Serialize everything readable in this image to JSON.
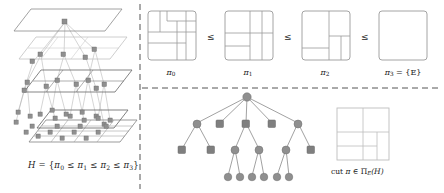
{
  "figure": {
    "panels": [
      "lattice-pyramid",
      "partition-chain",
      "cut-tree"
    ]
  },
  "left_panel": {
    "name": "lattice-pyramid",
    "caption_prefix": "H",
    "caption_eq": " = {",
    "caption_chain": [
      {
        "sym": "π",
        "sub": "0"
      },
      {
        "rel": "≤"
      },
      {
        "sym": "π",
        "sub": "1"
      },
      {
        "rel": "≤"
      },
      {
        "sym": "π",
        "sub": "2"
      },
      {
        "rel": "≤"
      },
      {
        "sym": "π",
        "sub": "3"
      }
    ],
    "caption_suffix": "}",
    "caption_text": "H = {π0 ≤ π1 ≤ π2 ≤ π3}",
    "levels": 4,
    "level_node_counts": [
      1,
      3,
      6,
      12
    ],
    "plane_colors": [
      "#8a8a8a",
      "#b9b9b9",
      "#6f6f6f",
      "#8a8a8a"
    ],
    "node_shape": "square",
    "node_color": "#8f8f8f"
  },
  "top_right_panel": {
    "name": "partition-chain",
    "relation_symbol": "≤",
    "items": [
      {
        "id": "pi0",
        "label": "π",
        "sublabel": "0",
        "label_full": "π0",
        "cells": 9,
        "lines": [
          {
            "type": "v",
            "x": 0.26,
            "y1": 0.0,
            "y2": 0.42
          },
          {
            "type": "v",
            "x": 0.4,
            "y1": 0.0,
            "y2": 0.2
          },
          {
            "type": "h",
            "y": 0.2,
            "x1": 0.4,
            "x2": 1.0
          },
          {
            "type": "h",
            "y": 0.42,
            "x1": 0.0,
            "x2": 1.0
          },
          {
            "type": "v",
            "x": 0.6,
            "y1": 0.2,
            "y2": 1.0
          },
          {
            "type": "v",
            "x": 0.8,
            "y1": 0.0,
            "y2": 1.0
          },
          {
            "type": "h",
            "y": 0.62,
            "x1": 0.0,
            "x2": 0.8
          },
          {
            "type": "h",
            "y": 0.42,
            "x1": 0.6,
            "x2": 1.0
          }
        ]
      },
      {
        "id": "pi1",
        "label": "π",
        "sublabel": "1",
        "label_full": "π1",
        "cells": 7,
        "lines": [
          {
            "type": "v",
            "x": 0.52,
            "y1": 0.0,
            "y2": 1.0
          },
          {
            "type": "v",
            "x": 0.76,
            "y1": 0.0,
            "y2": 1.0
          },
          {
            "type": "h",
            "y": 0.44,
            "x1": 0.0,
            "x2": 1.0
          },
          {
            "type": "h",
            "y": 0.72,
            "x1": 0.0,
            "x2": 0.52
          }
        ]
      },
      {
        "id": "pi2",
        "label": "π",
        "sublabel": "2",
        "label_full": "π2",
        "cells": 5,
        "lines": [
          {
            "type": "v",
            "x": 0.56,
            "y1": 0.0,
            "y2": 1.0
          },
          {
            "type": "h",
            "y": 0.5,
            "x1": 0.56,
            "x2": 1.0
          },
          {
            "type": "v",
            "x": 0.8,
            "y1": 0.5,
            "y2": 1.0
          },
          {
            "type": "h",
            "y": 0.76,
            "x1": 0.0,
            "x2": 0.56
          }
        ]
      },
      {
        "id": "pi3",
        "label": "π",
        "sublabel": "3",
        "label_full": "π3 = {E}",
        "suffix": " = {E}",
        "cells": 1,
        "lines": []
      }
    ]
  },
  "bottom_right_panel": {
    "name": "cut-tree",
    "caption": "cut π ∈ ΠE(H)",
    "caption_parts": {
      "cut": "cut ",
      "pi": "π",
      "in": " ∈ ",
      "Pi": "Π",
      "sub": "E",
      "arg": "(H)"
    },
    "node_circle_color": "#8f8f8f",
    "node_square_color": "#7a7a7a",
    "tree": {
      "root": {
        "id": "r",
        "shape": "circle"
      },
      "level1": [
        {
          "id": "a",
          "shape": "circle"
        },
        {
          "id": "b",
          "shape": "square"
        },
        {
          "id": "c",
          "shape": "square"
        },
        {
          "id": "d",
          "shape": "square"
        },
        {
          "id": "e",
          "shape": "circle"
        }
      ],
      "level2": [
        {
          "id": "a1",
          "shape": "square",
          "parent": "a"
        },
        {
          "id": "a2",
          "shape": "square",
          "parent": "a"
        },
        {
          "id": "c1",
          "shape": "circle",
          "parent": "c"
        },
        {
          "id": "c2",
          "shape": "circle",
          "parent": "c"
        },
        {
          "id": "e1",
          "shape": "circle",
          "parent": "e"
        },
        {
          "id": "e2",
          "shape": "square",
          "parent": "e"
        }
      ],
      "level3": [
        {
          "id": "c11",
          "shape": "circle",
          "parent": "c1"
        },
        {
          "id": "c12",
          "shape": "circle",
          "parent": "c1"
        },
        {
          "id": "c21",
          "shape": "circle",
          "parent": "c2"
        },
        {
          "id": "c22",
          "shape": "circle",
          "parent": "c2"
        },
        {
          "id": "e11",
          "shape": "circle",
          "parent": "e1"
        },
        {
          "id": "e12",
          "shape": "circle",
          "parent": "e1"
        }
      ]
    },
    "mini_square": {
      "cells": 6,
      "lines": [
        {
          "type": "v",
          "x": 0.5,
          "y1": 0.0,
          "y2": 1.0
        },
        {
          "type": "h",
          "y": 0.46,
          "x1": 0.0,
          "x2": 1.0
        },
        {
          "type": "h",
          "y": 0.74,
          "x1": 0.0,
          "x2": 0.76
        },
        {
          "type": "v",
          "x": 0.76,
          "y1": 0.46,
          "y2": 1.0
        }
      ]
    }
  },
  "dividers": {
    "vertical_dashed": true,
    "horizontal_dashed": true,
    "color": "#555555"
  },
  "colors": {
    "stroke": "#8a8a8a",
    "stroke_dark": "#5a5a5a",
    "node_fill": "#8f8f8f",
    "text": "#1a1a1a"
  }
}
